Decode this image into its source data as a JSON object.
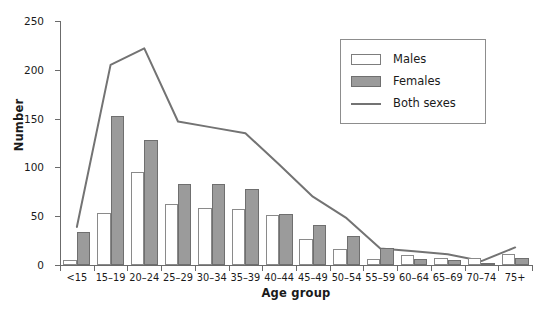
{
  "chart_data": {
    "type": "bar",
    "title": "",
    "xlabel": "Age group",
    "ylabel": "Number",
    "categories": [
      "<15",
      "15–19",
      "20–24",
      "25–29",
      "30–34",
      "35–39",
      "40–44",
      "45–49",
      "50–54",
      "55–59",
      "60–64",
      "65–69",
      "70–74",
      "75+"
    ],
    "series": [
      {
        "name": "Males",
        "kind": "bar",
        "color": "#ffffff",
        "edge_color": "#8a8a8a",
        "values": [
          5,
          53,
          95,
          63,
          58,
          57,
          51,
          27,
          16,
          6,
          10,
          7,
          7,
          11
        ]
      },
      {
        "name": "Females",
        "kind": "bar",
        "color": "#9b9b9b",
        "edge_color": "#6f6f6f",
        "values": [
          34,
          153,
          128,
          83,
          83,
          78,
          52,
          41,
          30,
          17,
          6,
          5,
          1,
          7
        ]
      },
      {
        "name": "Both sexes",
        "kind": "line",
        "color": "#737373",
        "values": [
          39,
          205,
          222,
          147,
          141,
          135,
          103,
          70,
          48,
          17,
          14,
          11,
          4,
          18
        ]
      }
    ],
    "ylim": [
      0,
      250
    ],
    "yticks": [
      0,
      50,
      100,
      150,
      200,
      250
    ],
    "ytick_labels": [
      "0",
      "50",
      "100",
      "150",
      "200",
      "250"
    ],
    "grid": false,
    "legend_position": "upper right",
    "legend_entries": [
      "Males",
      "Females",
      "Both sexes"
    ]
  },
  "axes": {
    "y_title": "Number",
    "x_title": "Age group"
  },
  "legend": {
    "items": [
      {
        "label": "Males",
        "swatch": "square-open-icon"
      },
      {
        "label": "Females",
        "swatch": "square-filled-icon"
      },
      {
        "label": "Both sexes",
        "swatch": "line-icon"
      }
    ]
  },
  "artifact": {
    "text": ""
  }
}
